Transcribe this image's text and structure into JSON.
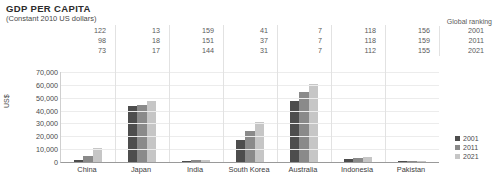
{
  "header": {
    "title": "GDP PER CAPITA",
    "subtitle": "(Constant 2010 US dollars)"
  },
  "ranking": {
    "header_label": "Global ranking",
    "years": [
      "2001",
      "2011",
      "2021"
    ],
    "rows": [
      [
        "122",
        "13",
        "159",
        "41",
        "7",
        "118",
        "156"
      ],
      [
        "98",
        "18",
        "151",
        "37",
        "7",
        "118",
        "159"
      ],
      [
        "73",
        "17",
        "144",
        "31",
        "7",
        "112",
        "155"
      ]
    ]
  },
  "legend": {
    "position": "right",
    "items": [
      {
        "label": "2001",
        "color": "#4d4d4d"
      },
      {
        "label": "2011",
        "color": "#8a8a8a"
      },
      {
        "label": "2021",
        "color": "#c6c6c6"
      }
    ]
  },
  "chart_data": {
    "type": "bar",
    "title": "GDP PER CAPITA",
    "subtitle": "(Constant 2010 US dollars)",
    "xlabel": "",
    "ylabel": "US$",
    "ylim": [
      0,
      70000
    ],
    "yticks": [
      "0",
      "10,000",
      "20,000",
      "30,000",
      "40,000",
      "50,000",
      "60,000",
      "70,000"
    ],
    "ytick_values": [
      0,
      10000,
      20000,
      30000,
      40000,
      50000,
      60000,
      70000
    ],
    "grid": true,
    "categories": [
      "China",
      "Japan",
      "India",
      "South Korea",
      "Australia",
      "Indonesia",
      "Pakistan"
    ],
    "series": [
      {
        "name": "2001",
        "color": "#4d4d4d",
        "values": [
          1600,
          43500,
          800,
          17000,
          47500,
          2000,
          900
        ]
      },
      {
        "name": "2011",
        "color": "#8a8a8a",
        "values": [
          5000,
          44500,
          1200,
          24000,
          54500,
          3000,
          1000
        ]
      },
      {
        "name": "2021",
        "color": "#c6c6c6",
        "values": [
          11000,
          47500,
          1900,
          31000,
          60500,
          3900,
          1150
        ]
      }
    ]
  }
}
